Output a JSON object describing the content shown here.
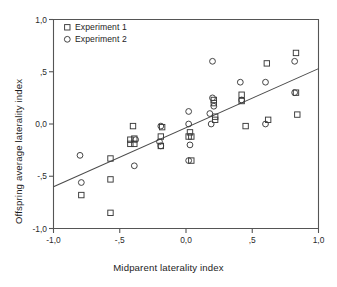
{
  "figure": {
    "ghost_header": "",
    "legend": {
      "entries": [
        {
          "label": "Experiment 1",
          "marker": "square"
        },
        {
          "label": "Experiment 2",
          "marker": "circle"
        }
      ]
    }
  },
  "chart_data": {
    "type": "scatter",
    "title": "",
    "xlabel": "Midparent laterality index",
    "ylabel": "Offspring average laterality index",
    "xlim": [
      -1.0,
      1.0
    ],
    "ylim": [
      -1.0,
      1.0
    ],
    "grid": false,
    "legend_position": "top-left",
    "xticks": [
      -1.0,
      -0.5,
      0.0,
      0.5,
      1.0
    ],
    "xticklabels": [
      "-1,0",
      "-,5",
      "0,0",
      ",5",
      "1,0"
    ],
    "yticks": [
      -1.0,
      -0.5,
      0.0,
      0.5,
      1.0
    ],
    "yticklabels": [
      "-1,0",
      "-,5",
      "0,0",
      ",5",
      "1,0"
    ],
    "decimal_separator": ",",
    "series": [
      {
        "name": "Experiment 1",
        "marker": "square",
        "points": [
          [
            -0.79,
            -0.68
          ],
          [
            -0.57,
            -0.33
          ],
          [
            -0.57,
            -0.53
          ],
          [
            -0.57,
            -0.85
          ],
          [
            -0.4,
            -0.02
          ],
          [
            -0.42,
            -0.15
          ],
          [
            -0.39,
            -0.14
          ],
          [
            -0.42,
            -0.19
          ],
          [
            -0.39,
            -0.19
          ],
          [
            -0.19,
            -0.12
          ],
          [
            -0.18,
            -0.03
          ],
          [
            -0.19,
            -0.21
          ],
          [
            0.03,
            -0.08
          ],
          [
            0.04,
            -0.12
          ],
          [
            0.02,
            -0.12
          ],
          [
            0.04,
            -0.35
          ],
          [
            0.21,
            0.2
          ],
          [
            0.21,
            0.23
          ],
          [
            0.22,
            0.07
          ],
          [
            0.22,
            0.04
          ],
          [
            0.42,
            0.28
          ],
          [
            0.42,
            0.22
          ],
          [
            0.45,
            -0.02
          ],
          [
            0.61,
            0.58
          ],
          [
            0.62,
            0.04
          ],
          [
            0.83,
            0.68
          ],
          [
            0.83,
            0.3
          ],
          [
            0.84,
            0.09
          ]
        ]
      },
      {
        "name": "Experiment 2",
        "marker": "circle",
        "points": [
          [
            -0.8,
            -0.3
          ],
          [
            -0.79,
            -0.56
          ],
          [
            -0.39,
            -0.4
          ],
          [
            -0.38,
            -0.15
          ],
          [
            -0.19,
            -0.02
          ],
          [
            -0.2,
            -0.17
          ],
          [
            -0.19,
            -0.21
          ],
          [
            0.02,
            0.12
          ],
          [
            0.02,
            0.0
          ],
          [
            0.03,
            -0.2
          ],
          [
            0.02,
            -0.35
          ],
          [
            0.18,
            0.1
          ],
          [
            0.19,
            0.0
          ],
          [
            0.2,
            0.25
          ],
          [
            0.21,
            0.17
          ],
          [
            0.2,
            0.6
          ],
          [
            0.41,
            0.4
          ],
          [
            0.42,
            0.23
          ],
          [
            0.6,
            0.4
          ],
          [
            0.6,
            0.0
          ],
          [
            0.82,
            0.6
          ],
          [
            0.82,
            0.3
          ]
        ]
      }
    ],
    "fit_line": {
      "type": "linear-regression",
      "x": [
        -1.0,
        1.0
      ],
      "y": [
        -0.6,
        0.53
      ]
    }
  }
}
